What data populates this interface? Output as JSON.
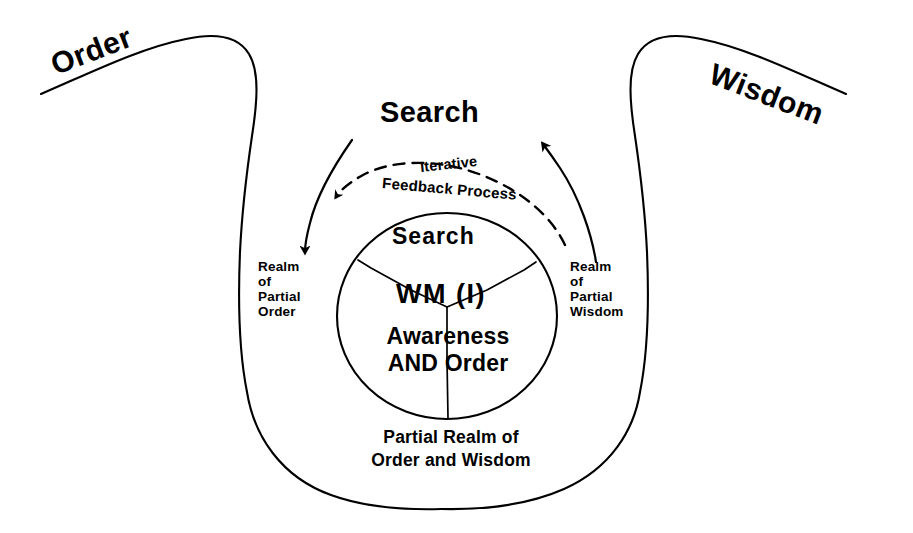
{
  "diagram": {
    "title": "Search",
    "axis_labels": {
      "left": "Order",
      "right": "Wisdom"
    },
    "feedback": {
      "line1": "Iterative",
      "line2": "Feedback Process"
    },
    "realms": {
      "left": "Realm\nof\nPartial\nOrder",
      "right": "Realm\nof\nPartial\nWisdom",
      "bottom": "Partial Realm of\nOrder and Wisdom"
    },
    "core": {
      "search": "Search",
      "wm": "WM (I)",
      "awareness": "Awareness\nAND Order"
    },
    "colors": {
      "ink": "#000000",
      "background": "#ffffff"
    },
    "icons": {
      "arrow_down_left": "arrow-down-left-icon",
      "arrow_up_right": "arrow-up-right-icon",
      "dashed_feedback_arrow": "dashed-feedback-arrow-icon"
    }
  }
}
